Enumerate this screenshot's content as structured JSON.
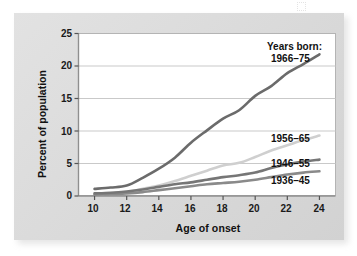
{
  "figure": {
    "background_color": "#dcdcdc",
    "plot_background_color": "#ffffff",
    "plot_border_color": "#b4b4b4",
    "gridline_color": "#c9c9c9"
  },
  "legend": {
    "title": "Years born:",
    "position": "right-inline"
  },
  "chart_data": {
    "type": "line",
    "title": "",
    "subtitle": "",
    "xlabel": "Age of onset",
    "ylabel": "Percent of population",
    "xlim": [
      9,
      25
    ],
    "ylim": [
      0,
      25
    ],
    "xticks": [
      10,
      12,
      14,
      16,
      18,
      20,
      22,
      24
    ],
    "xtick_labels": [
      "10",
      "12",
      "14",
      "16",
      "18",
      "20",
      "22",
      "24"
    ],
    "yticks": [
      0,
      5,
      10,
      15,
      20,
      25
    ],
    "ytick_labels": [
      "0",
      "5",
      "10",
      "15",
      "20",
      "25"
    ],
    "grid": "horizontal",
    "legend_position": "inline-right",
    "x": [
      10,
      11,
      12,
      13,
      14,
      15,
      16,
      17,
      18,
      19,
      20,
      21,
      22,
      23,
      24
    ],
    "series": [
      {
        "name": "1966-75",
        "label": "1966–75",
        "color": "#6b6b6b",
        "width": 2.6,
        "values": [
          1.1,
          1.3,
          1.6,
          2.8,
          4.2,
          5.9,
          8.2,
          10.1,
          11.9,
          13.2,
          15.4,
          16.9,
          18.9,
          20.3,
          21.8
        ]
      },
      {
        "name": "1956-65",
        "label": "1956–65",
        "color": "#cfcfcf",
        "width": 2.6,
        "values": [
          0.3,
          0.4,
          0.6,
          1.1,
          1.6,
          2.3,
          3.1,
          3.9,
          4.7,
          5.1,
          6.0,
          7.0,
          7.8,
          8.6,
          9.3
        ]
      },
      {
        "name": "1946-55",
        "label": "1946–55",
        "color": "#767676",
        "width": 2.6,
        "values": [
          0.4,
          0.5,
          0.7,
          1.0,
          1.4,
          1.8,
          2.1,
          2.5,
          2.9,
          3.2,
          3.6,
          4.3,
          4.9,
          5.3,
          5.6
        ]
      },
      {
        "name": "1936-45",
        "label": "1936–45",
        "color": "#8a8a8a",
        "width": 2.6,
        "values": [
          0.2,
          0.3,
          0.4,
          0.6,
          0.9,
          1.2,
          1.5,
          1.8,
          2.0,
          2.2,
          2.5,
          2.9,
          3.3,
          3.6,
          3.8
        ]
      }
    ],
    "series_end_labels": [
      {
        "label": "1966–75",
        "x": 24,
        "y": 21.8
      },
      {
        "label": "1956–65",
        "x": 24,
        "y": 9.3
      },
      {
        "label": "1946–55",
        "x": 24,
        "y": 5.6
      },
      {
        "label": "1936–45",
        "x": 24,
        "y": 3.8
      }
    ]
  }
}
